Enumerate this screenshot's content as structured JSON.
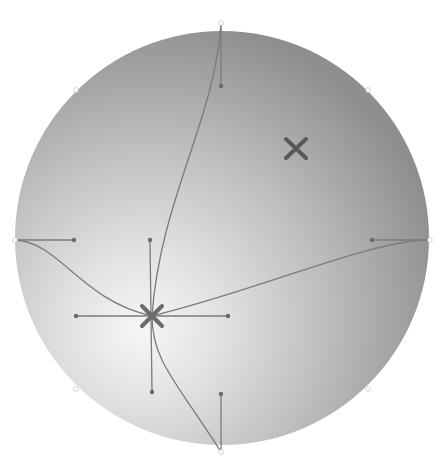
{
  "canvas": {
    "width": 445,
    "height": 471,
    "background": "#ffffff"
  },
  "gradient_shape": {
    "type": "circle",
    "center": [
      222,
      238
    ],
    "radius": 207,
    "gradient_type": "radial",
    "gradient_origin": [
      152,
      316
    ],
    "stop_light": "#f4f4f4",
    "stop_mid": "#c8c8c8",
    "stop_dark": "#8c8c8c"
  },
  "mesh": {
    "line_color": "#7a7a7a",
    "handle_dot_color": "#6a6a6a",
    "edge_anchor_color": "#ffffff",
    "edge_anchors": [
      {
        "name": "top",
        "x": 221,
        "y": 23
      },
      {
        "name": "bottom",
        "x": 221,
        "y": 452
      },
      {
        "name": "left",
        "x": 15,
        "y": 240
      },
      {
        "name": "right",
        "x": 430,
        "y": 240
      },
      {
        "name": "top-left",
        "x": 76,
        "y": 90
      },
      {
        "name": "top-right",
        "x": 368,
        "y": 90
      },
      {
        "name": "bottom-left",
        "x": 76,
        "y": 389
      },
      {
        "name": "bottom-right",
        "x": 368,
        "y": 389
      }
    ]
  },
  "markers": {
    "gradient_center": {
      "x": 152,
      "y": 316,
      "size": 12,
      "color": "#6a6a6a"
    },
    "focal_point": {
      "x": 296,
      "y": 148,
      "size": 10,
      "color": "#5a5a5a"
    }
  }
}
